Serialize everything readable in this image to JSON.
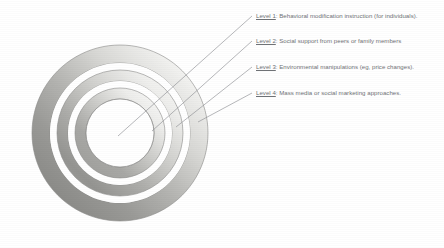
{
  "figure": {
    "type": "concentric-ring-target-diagram",
    "ring_count": 4,
    "center": {
      "x": 120,
      "y": 133
    },
    "outer_radius": 88,
    "colors": {
      "ring_light": "#f2f2f1",
      "ring_mid": "#c9c9c7",
      "ring_dark": "#8f8f8d",
      "ring_outline": "#8a8a88",
      "leader_line": "#8e9095",
      "label_text": "#6f7276",
      "background": "#ffffff"
    },
    "rings": [
      {
        "index": 1,
        "label_ref": "Level 1",
        "outer_r": 34,
        "inner_r": 0
      },
      {
        "index": 2,
        "label_ref": "Level 2",
        "outer_r": 52,
        "inner_r": 34
      },
      {
        "index": 3,
        "label_ref": "Level 3",
        "outer_r": 70,
        "inner_r": 52
      },
      {
        "index": 4,
        "label_ref": "Level 4",
        "outer_r": 88,
        "inner_r": 70
      }
    ]
  },
  "labels": [
    {
      "key": "Level 1",
      "separator": ":",
      "text": "Behavioral modification instruction (for individuals).",
      "x": 256,
      "y": 12,
      "leader": {
        "x1": 252,
        "y1": 16,
        "x2": 118,
        "y2": 136
      }
    },
    {
      "key": "Level 2",
      "separator": ":",
      "text": "Social support from peers or family members",
      "x": 256,
      "y": 37,
      "leader": {
        "x1": 252,
        "y1": 41,
        "x2": 152,
        "y2": 131
      }
    },
    {
      "key": "Level 3",
      "separator": ":",
      "text": "Environmental manipulations (eg, price changes).",
      "x": 256,
      "y": 63,
      "leader": {
        "x1": 252,
        "y1": 67,
        "x2": 176,
        "y2": 127
      }
    },
    {
      "key": "Level 4",
      "separator": ":",
      "text": "Mass media or social marketing approaches.",
      "x": 256,
      "y": 89,
      "leader": {
        "x1": 252,
        "y1": 93,
        "x2": 198,
        "y2": 122
      }
    }
  ]
}
